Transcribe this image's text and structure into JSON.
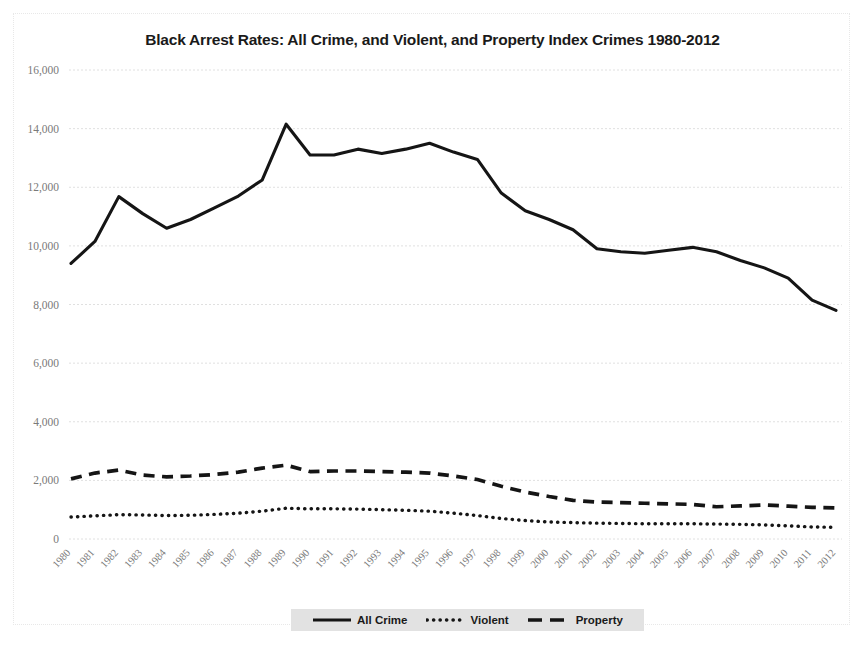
{
  "chart_data": {
    "type": "line",
    "title": "Black Arrest Rates: All Crime, and Violent, and Property Index Crimes 1980-2012",
    "xlabel": "",
    "ylabel": "",
    "ylim": [
      0,
      16000
    ],
    "ytick_values": [
      0,
      2000,
      4000,
      6000,
      8000,
      10000,
      12000,
      14000,
      16000
    ],
    "ytick_labels": [
      "0",
      "2,000",
      "4,000",
      "6,000",
      "8,000",
      "10,000",
      "12,000",
      "14,000",
      "16,000"
    ],
    "grid": true,
    "legend_position": "bottom",
    "categories": [
      "1980",
      "1981",
      "1982",
      "1983",
      "1984",
      "1985",
      "1986",
      "1987",
      "1988",
      "1989",
      "1990",
      "1991",
      "1992",
      "1993",
      "1994",
      "1995",
      "1996",
      "1997",
      "1998",
      "1999",
      "2000",
      "2001",
      "2002",
      "2003",
      "2004",
      "2005",
      "2006",
      "2007",
      "2008",
      "2009",
      "2010",
      "2011",
      "2012"
    ],
    "series": [
      {
        "name": "All Crime",
        "style": "solid",
        "color": "#151515",
        "values": [
          9400,
          10150,
          11680,
          11100,
          10600,
          10900,
          11300,
          11700,
          12250,
          14150,
          13100,
          13100,
          13300,
          13150,
          13300,
          13500,
          13200,
          12950,
          11800,
          11200,
          10900,
          10550,
          9900,
          9800,
          9750,
          9850,
          9950,
          9800,
          9500,
          9250,
          8900,
          8150,
          7800
        ]
      },
      {
        "name": "Violent",
        "style": "dotted",
        "color": "#151515",
        "values": [
          750,
          790,
          830,
          820,
          800,
          810,
          840,
          880,
          950,
          1050,
          1030,
          1030,
          1020,
          1000,
          980,
          950,
          880,
          800,
          700,
          630,
          580,
          560,
          540,
          530,
          520,
          520,
          520,
          510,
          500,
          480,
          450,
          410,
          400
        ]
      },
      {
        "name": "Property",
        "style": "dashed",
        "color": "#151515",
        "values": [
          2050,
          2250,
          2350,
          2180,
          2120,
          2150,
          2200,
          2280,
          2420,
          2520,
          2300,
          2320,
          2320,
          2300,
          2280,
          2250,
          2150,
          2030,
          1800,
          1600,
          1450,
          1320,
          1260,
          1240,
          1220,
          1200,
          1180,
          1100,
          1130,
          1160,
          1120,
          1080,
          1060
        ]
      }
    ]
  },
  "legend": {
    "items": [
      {
        "label": "All Crime",
        "style": "solid"
      },
      {
        "label": "Violent",
        "style": "dotted"
      },
      {
        "label": "Property",
        "style": "dashed"
      }
    ]
  }
}
